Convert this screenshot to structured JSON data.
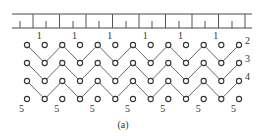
{
  "figure": {
    "caption": "(a)",
    "colors": {
      "line": "#4a4a4a",
      "node_stroke": "#333333",
      "node_fill": "#ffffff",
      "text": "#333333"
    }
  },
  "ruler": {
    "x_start": 12,
    "x_end": 252,
    "top_y": 14,
    "bottom_y": 28,
    "major_ticks_x": [
      33,
      59.5,
      86,
      112.5,
      139,
      165.5,
      192,
      218.5,
      245
    ],
    "minor_ticks_x": [
      20,
      46,
      73,
      99,
      126,
      152,
      179,
      205,
      232
    ],
    "minor_tick_top_y": 21
  },
  "grid": {
    "columns_x": [
      27,
      44.7,
      62.3,
      80,
      97.7,
      115.3,
      133,
      150.7,
      168.3,
      186,
      203.7,
      221.3,
      239
    ],
    "rows_y": [
      45,
      63,
      81,
      99
    ],
    "node_radius": 2.6
  },
  "lines": [
    {
      "id": "2",
      "peak_row": 0,
      "trough_row": 1,
      "label": "2"
    },
    {
      "id": "3",
      "peak_row": 1,
      "trough_row": 2,
      "label": "3"
    },
    {
      "id": "4",
      "peak_row": 2,
      "trough_row": 3,
      "label": "4"
    }
  ],
  "top_labels": {
    "text": "1",
    "columns": [
      1,
      3,
      5,
      7,
      9,
      11
    ]
  },
  "bottom_labels": {
    "text": "5",
    "columns": [
      0,
      2,
      4,
      6,
      8,
      10,
      12
    ]
  }
}
